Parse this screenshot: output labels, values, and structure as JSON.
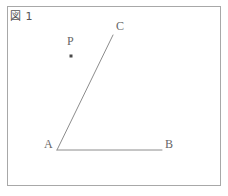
{
  "figure": {
    "caption": "図 1",
    "frame_color": "#a8a8a8",
    "background_color": "#ffffff",
    "stroke_color": "#8c8c8c",
    "label_color": "#666666"
  },
  "labels": {
    "a": "A",
    "b": "B",
    "c": "C",
    "p": "P"
  },
  "chart_data": {
    "type": "diagram",
    "title": "図 1",
    "points": [
      {
        "name": "A",
        "x": 57,
        "y": 150,
        "label_dx": -13,
        "label_dy": -6,
        "marked": false
      },
      {
        "name": "B",
        "x": 162,
        "y": 150,
        "label_dx": 3,
        "label_dy": -6,
        "marked": false
      },
      {
        "name": "C",
        "x": 113,
        "y": 35,
        "label_dx": 3,
        "label_dy": -9,
        "marked": false
      },
      {
        "name": "P",
        "x": 71,
        "y": 56,
        "label_dx": -4,
        "label_dy": -15,
        "marked": true
      }
    ],
    "segments": [
      {
        "name": "AB",
        "from": "A",
        "to": "B",
        "x1": 57,
        "y1": 150,
        "x2": 162,
        "y2": 150
      },
      {
        "name": "AC",
        "from": "A",
        "to": "C",
        "x1": 57,
        "y1": 150,
        "x2": 113,
        "y2": 35
      }
    ],
    "frame": {
      "x": 7,
      "y": 6,
      "width": 214,
      "height": 180
    },
    "xlim": [
      0,
      228
    ],
    "ylim": [
      0,
      196
    ],
    "grid": false,
    "legend": null
  }
}
